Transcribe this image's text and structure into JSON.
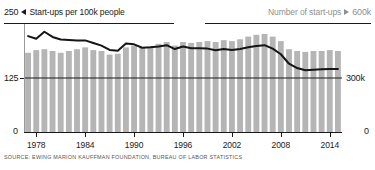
{
  "header": {
    "left_axis_max": "250",
    "left_marker_icon": "triangle-left-icon",
    "left_series_label": "Start-ups per 100k people",
    "right_series_label": "Number of start-ups",
    "right_marker_icon": "triangle-right-icon",
    "right_axis_max": "600k"
  },
  "axes": {
    "left_ticks": [
      "250",
      "125",
      "0"
    ],
    "right_ticks": [
      "600k",
      "300k",
      "0"
    ],
    "x_ticks": [
      "1978",
      "1984",
      "1990",
      "1996",
      "2002",
      "2008",
      "2014"
    ]
  },
  "source": "SOURCE: EWING MARION KAUFFMAN FOUNDATION, BUREAU OF LABOR STATISTICS",
  "colors": {
    "bar": "#b5b5b5",
    "line": "#151515",
    "axis": "#1a1a1a",
    "muted_text": "#8f8f8f",
    "background": "#ffffff"
  },
  "chart_data": {
    "type": "bar",
    "title": "",
    "subtitle": "",
    "xlabel": "",
    "ylabel": "Start-ups per 100k people",
    "y2label": "Number of start-ups",
    "ylim": [
      0,
      250
    ],
    "y2lim": [
      0,
      600000
    ],
    "xlim": [
      1977,
      2015
    ],
    "grid": false,
    "legend": "top",
    "x": [
      1977,
      1978,
      1979,
      1980,
      1981,
      1982,
      1983,
      1984,
      1985,
      1986,
      1987,
      1988,
      1989,
      1990,
      1991,
      1992,
      1993,
      1994,
      1995,
      1996,
      1997,
      1998,
      1999,
      2000,
      2001,
      2002,
      2003,
      2004,
      2005,
      2006,
      2007,
      2008,
      2009,
      2010,
      2011,
      2012,
      2013,
      2014,
      2015
    ],
    "series": [
      {
        "name": "Number of start-ups",
        "type": "bar",
        "axis": "right",
        "unit": "start-ups",
        "values": [
          440000,
          455000,
          460000,
          450000,
          440000,
          450000,
          460000,
          470000,
          455000,
          450000,
          430000,
          435000,
          470000,
          480000,
          470000,
          475000,
          490000,
          500000,
          480000,
          500000,
          495000,
          500000,
          505000,
          500000,
          510000,
          505000,
          515000,
          530000,
          540000,
          545000,
          530000,
          505000,
          460000,
          450000,
          445000,
          450000,
          450000,
          455000,
          450000
        ]
      },
      {
        "name": "Start-ups per 100k people",
        "type": "line",
        "axis": "left",
        "unit": "per 100k people",
        "values": [
          222,
          216,
          232,
          220,
          214,
          213,
          212,
          212,
          206,
          200,
          190,
          188,
          205,
          203,
          195,
          196,
          198,
          201,
          192,
          198,
          194,
          194,
          193,
          189,
          192,
          190,
          192,
          196,
          199,
          201,
          193,
          180,
          158,
          148,
          143,
          144,
          145,
          146,
          146
        ]
      }
    ]
  }
}
